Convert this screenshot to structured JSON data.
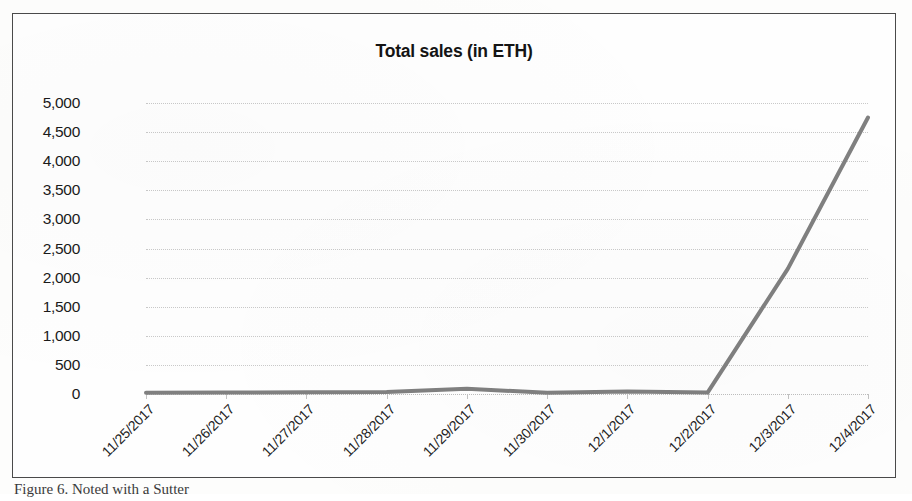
{
  "figure": {
    "caption": "Figure 6.    Noted with a Sutter"
  },
  "chart_data": {
    "type": "line",
    "title": "Total sales (in ETH)",
    "xlabel": "",
    "ylabel": "",
    "categories": [
      "11/25/2017",
      "11/26/2017",
      "11/27/2017",
      "11/28/2017",
      "11/29/2017",
      "11/30/2017",
      "12/1/2017",
      "12/2/2017",
      "12/3/2017",
      "12/4/2017"
    ],
    "values": [
      20,
      25,
      30,
      35,
      90,
      20,
      45,
      25,
      2150,
      4750
    ],
    "ylim": [
      0,
      5000
    ],
    "ytick_labels": [
      "5,000",
      "4,500",
      "4,000",
      "3,500",
      "3,000",
      "2,500",
      "2,000",
      "1,500",
      "1,000",
      "500",
      "0"
    ],
    "ytick_values": [
      5000,
      4500,
      4000,
      3500,
      3000,
      2500,
      2000,
      1500,
      1000,
      500,
      0
    ],
    "grid": true,
    "legend": false,
    "series_color": "#808080",
    "series_width": 4
  }
}
